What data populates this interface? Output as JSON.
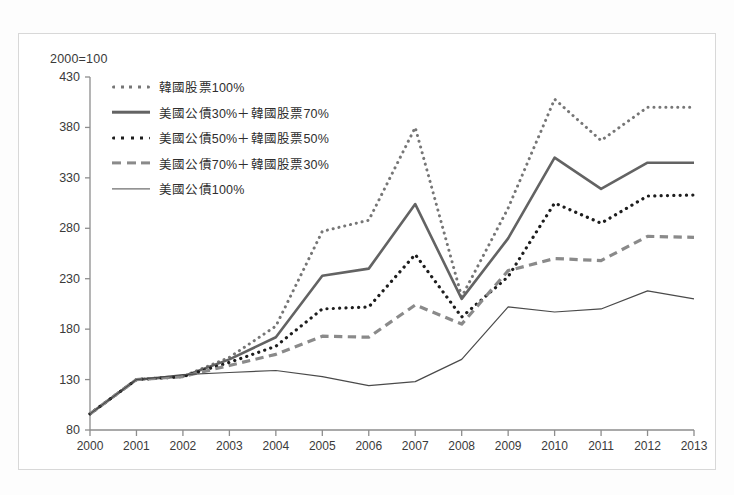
{
  "figure": {
    "index_note": "2000=100"
  },
  "chart_data": {
    "type": "line",
    "title": "",
    "subtitle": "",
    "xlabel": "",
    "ylabel": "",
    "annotations": [
      "2000=100"
    ],
    "grid": false,
    "legend_position": "top-left",
    "x": [
      2000,
      2001,
      2002,
      2003,
      2004,
      2005,
      2006,
      2007,
      2008,
      2009,
      2010,
      2011,
      2012,
      2013
    ],
    "categories": [
      "2000",
      "2001",
      "2002",
      "2003",
      "2004",
      "2005",
      "2006",
      "2007",
      "2008",
      "2009",
      "2010",
      "2011",
      "2012",
      "2013"
    ],
    "xlim": [
      2000,
      2013
    ],
    "ylim": [
      80,
      430
    ],
    "yticks": [
      80,
      130,
      180,
      230,
      280,
      330,
      380,
      430
    ],
    "xticks": [
      "2000",
      "2001",
      "2002",
      "2003",
      "2004",
      "2005",
      "2006",
      "2007",
      "2008",
      "2009",
      "2010",
      "2011",
      "2012",
      "2013"
    ],
    "series": [
      {
        "name": "韓國股票100%",
        "style": "dotted",
        "color": "#767676",
        "width": 3.0,
        "values": [
          96,
          130,
          133,
          152,
          183,
          277,
          288,
          380,
          212,
          300,
          408,
          367,
          400,
          400
        ]
      },
      {
        "name": "美國公債30%＋韓國股票70%",
        "style": "solid",
        "color": "#636363",
        "width": 2.6,
        "values": [
          96,
          130,
          133,
          150,
          172,
          233,
          240,
          304,
          210,
          270,
          350,
          319,
          345,
          345
        ]
      },
      {
        "name": "美國公債50%＋韓國股票50%",
        "style": "dotted",
        "color": "#1d1d1d",
        "width": 3.2,
        "values": [
          96,
          130,
          133,
          147,
          163,
          200,
          202,
          254,
          192,
          232,
          305,
          285,
          312,
          313
        ]
      },
      {
        "name": "美國公債70%＋韓國股票30%",
        "style": "dashed",
        "color": "#8a8a8a",
        "width": 3.2,
        "values": [
          96,
          130,
          133,
          144,
          155,
          173,
          172,
          204,
          185,
          238,
          250,
          248,
          272,
          271
        ]
      },
      {
        "name": "美國公債100%",
        "style": "solid",
        "color": "#4a4a4a",
        "width": 1.2,
        "values": [
          96,
          130,
          135,
          137,
          139,
          133,
          124,
          128,
          150,
          202,
          197,
          200,
          218,
          210
        ]
      }
    ]
  },
  "legend": {
    "items": [
      {
        "label": "韓國股票100%",
        "key": "dotted-line-key"
      },
      {
        "label": "美國公債30%＋韓國股票70%",
        "key": "solid-thick-line-key"
      },
      {
        "label": "美國公債50%＋韓國股票50%",
        "key": "dotted-bold-line-key"
      },
      {
        "label": "美國公債70%＋韓國股票30%",
        "key": "dashed-line-key"
      },
      {
        "label": "美國公債100%",
        "key": "solid-thin-line-key"
      }
    ]
  }
}
